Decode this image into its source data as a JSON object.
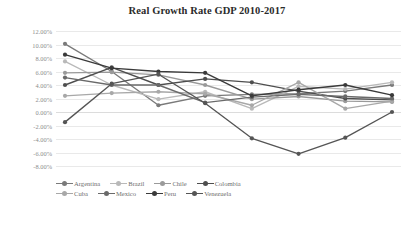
{
  "chart_data": {
    "type": "line",
    "title": "Real Growth Rate GDP 2010-2017",
    "xlabel": "",
    "ylabel": "",
    "grid": true,
    "legend_position": "bottom",
    "x": [
      "2010",
      "2011",
      "2012",
      "2013",
      "2014",
      "2015",
      "2016",
      "2017"
    ],
    "ylim": [
      -8,
      12
    ],
    "ytick_labels": [
      "12.00%",
      "10.00%",
      "8.00%",
      "6.00%",
      "4.00%",
      "2.00%",
      "0.00%",
      "-2.00%",
      "-4.00%",
      "-6.00%",
      "-8.00%"
    ],
    "ytick_values": [
      12,
      10,
      8,
      6,
      4,
      2,
      0,
      -2,
      -4,
      -6,
      -8
    ],
    "series": [
      {
        "name": "Argentina",
        "color": "#7a7a7a",
        "values": [
          10.1,
          6.0,
          1.0,
          2.4,
          2.6,
          2.7,
          3.1,
          4.0
        ]
      },
      {
        "name": "Brazil",
        "color": "#b9b9b9",
        "values": [
          7.5,
          4.0,
          1.9,
          3.0,
          0.5,
          3.8,
          3.4,
          4.4
        ]
      },
      {
        "name": "Chile",
        "color": "#9a9a9a",
        "values": [
          5.8,
          5.9,
          5.5,
          4.0,
          1.9,
          2.3,
          1.6,
          1.5
        ]
      },
      {
        "name": "Colombia",
        "color": "#4e4e4e",
        "values": [
          4.0,
          6.6,
          4.0,
          4.9,
          4.4,
          3.1,
          2.0,
          1.8
        ]
      },
      {
        "name": "Cuba",
        "color": "#a8a8a8",
        "values": [
          2.4,
          2.8,
          3.0,
          2.7,
          1.0,
          4.4,
          0.5,
          1.6
        ]
      },
      {
        "name": "Mexico",
        "color": "#6a6a6a",
        "values": [
          5.1,
          4.0,
          4.0,
          1.4,
          2.2,
          2.6,
          2.3,
          2.0
        ]
      },
      {
        "name": "Peru",
        "color": "#3a3a3a",
        "values": [
          8.5,
          6.5,
          6.0,
          5.8,
          2.4,
          3.3,
          4.0,
          2.5
        ]
      },
      {
        "name": "Venezuela",
        "color": "#555555",
        "values": [
          -1.5,
          4.2,
          5.6,
          1.3,
          -3.9,
          -6.2,
          -3.8,
          0.0
        ]
      }
    ]
  }
}
